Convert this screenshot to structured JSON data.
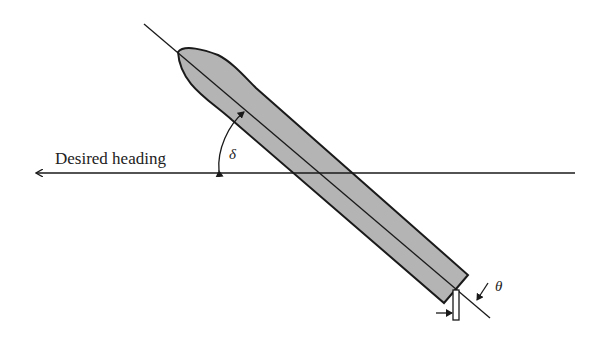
{
  "diagram": {
    "heading_label": "Desired heading",
    "angle_delta_label": "δ",
    "angle_theta_label": "θ",
    "colors": {
      "hull_fill": "#b4b4b4",
      "stroke": "#1a1a1a",
      "background": "#ffffff"
    }
  }
}
